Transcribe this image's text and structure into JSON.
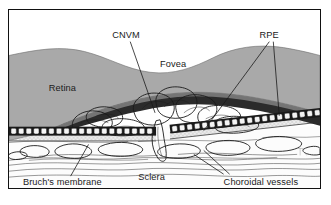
{
  "figure": {
    "type": "anatomical-cross-section",
    "view": "cross-section through retina, RPE, Bruch's membrane, choroid and sclera",
    "background_color": "#ffffff",
    "frame_color": "#111111"
  },
  "labels": {
    "cnvm": "CNVM",
    "rpe": "RPE",
    "fovea": "Fovea",
    "retina": "Retina",
    "sclera": "Sclera",
    "bruchs_membrane": "Bruch's membrane",
    "choroidal_vessels": "Choroidal vessels"
  },
  "layers": [
    {
      "name": "retina",
      "label": "Retina",
      "fill": "#a9a9a9",
      "description": "medium-gray neurosensory retina with wavy upper surface and central foveal depression"
    },
    {
      "name": "subretinal-space",
      "label": "",
      "fill": "#2b2b2b",
      "description": "dark lens-shaped subretinal elevation beneath the detached retina"
    },
    {
      "name": "cnvm",
      "label": "CNVM",
      "fill": "#fdfdfd",
      "description": "white lobulated neovascular membrane with a stalk perforating Bruch's membrane"
    },
    {
      "name": "rpe",
      "label": "RPE",
      "fill": "#f2f2f2",
      "description": "row of small rounded retinal pigment epithelium cells with dark nuclei, split into left and right segments"
    },
    {
      "name": "bruchs-membrane",
      "label": "Bruch's membrane",
      "fill": "#e8e8e8",
      "description": "thin stippled band immediately beneath the RPE cell row"
    },
    {
      "name": "choroid",
      "label": "Choroidal vessels",
      "fill": "#ffffff",
      "description": "irregular white vessel lumen outlines within the choroid"
    },
    {
      "name": "sclera",
      "label": "Sclera",
      "fill": "#fbfbfb",
      "description": "pale fibrous layer with fine wavy collagen striations at the base"
    }
  ],
  "annotations": [
    {
      "id": "cnvm",
      "text": "CNVM",
      "leaders": 1,
      "points_to": "central neovascular membrane"
    },
    {
      "id": "rpe",
      "text": "RPE",
      "leaders": 2,
      "points_to": "left and right RPE cell rows"
    },
    {
      "id": "fovea",
      "text": "Fovea",
      "leaders": 0,
      "points_to": "central retinal depression"
    },
    {
      "id": "retina",
      "text": "Retina",
      "leaders": 0,
      "points_to": "gray retinal layer"
    },
    {
      "id": "sclera",
      "text": "Sclera",
      "leaders": 0,
      "points_to": "basal fibrous layer"
    },
    {
      "id": "bruchs",
      "text": "Bruch's membrane",
      "leaders": 1,
      "points_to": "stippled band under RPE"
    },
    {
      "id": "choroidal",
      "text": "Choroidal vessels",
      "leaders": 2,
      "points_to": "white vessel lumens in choroid"
    }
  ],
  "colors": {
    "retina_gray": "#a9a9a9",
    "subretinal_dark": "#2b2b2b",
    "ink": "#1a1a1a",
    "paper": "#ffffff"
  }
}
